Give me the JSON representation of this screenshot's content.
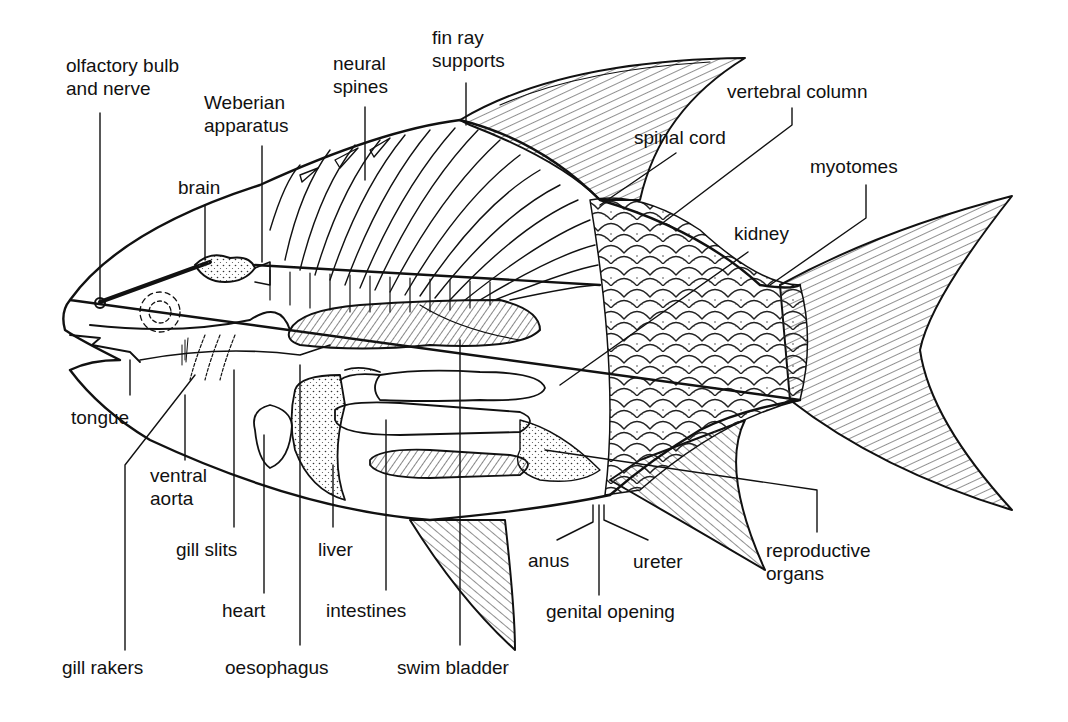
{
  "diagram": {
    "labels": {
      "olfactory": [
        "olfactory bulb",
        "and nerve"
      ],
      "weberian": [
        "Weberian",
        "apparatus"
      ],
      "neural_spines": [
        "neural",
        "spines"
      ],
      "fin_ray": [
        "fin ray",
        "supports"
      ],
      "vertebral_column": "vertebral column",
      "spinal_cord": "spinal cord",
      "myotomes": "myotomes",
      "brain": "brain",
      "kidney": "kidney",
      "tongue": "tongue",
      "ventral_aorta": [
        "ventral",
        "aorta"
      ],
      "gill_slits": "gill slits",
      "liver": "liver",
      "heart": "heart",
      "intestines": "intestines",
      "anus": "anus",
      "ureter": "ureter",
      "reproductive_organs": [
        "reproductive",
        "organs"
      ],
      "genital_opening": "genital opening",
      "gill_rakers": "gill rakers",
      "oesophagus": "oesophagus",
      "swim_bladder": "swim bladder"
    },
    "colors": {
      "ink": "#111111",
      "background": "#ffffff"
    }
  }
}
